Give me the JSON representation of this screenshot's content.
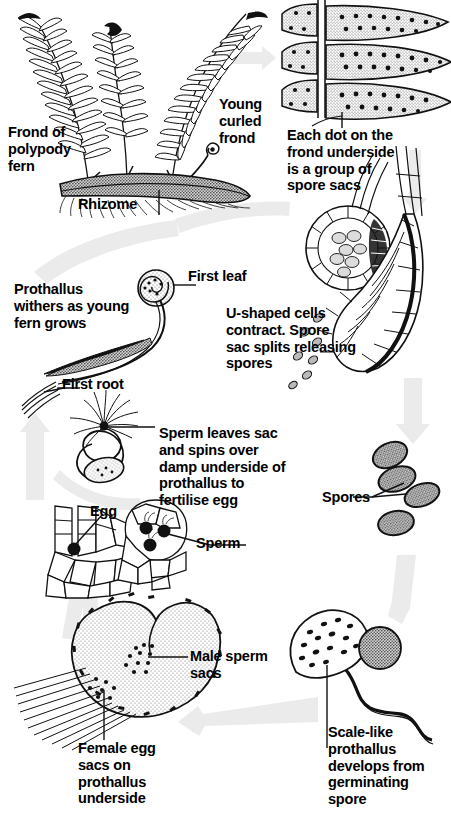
{
  "figure": {
    "type": "biological-life-cycle-diagram",
    "background_color": "#ffffff",
    "ink_color": "#111111",
    "arrow_color": "#ebebeb"
  },
  "labels": {
    "frond_of_polypody_fern": "Frond of\npolypody\nfern",
    "rhizome": "Rhizome",
    "young_curled_frond": "Young\ncurled\nfrond",
    "each_dot_spore_sacs": "Each dot on the\nfrond underside\nis a group of\nspore sacs",
    "prothallus_withers": "Prothallus\nwithers as young\nfern grows",
    "first_leaf": "First leaf",
    "first_root": "First root",
    "u_shaped_cells": "U-shaped cells\ncontract. Spore\nsac splits releasing\nspores",
    "sperm_leaves_sac": "Sperm leaves sac\nand spins over\ndamp underside of\nprothallus to\nfertilise egg",
    "spores": "Spores",
    "egg": "Egg",
    "sperm": "Sperm",
    "male_sperm_sacs": "Male sperm\nsacs",
    "female_egg_sacs": "Female egg\nsacs on\nprothallus\nunderside",
    "scale_like_prothallus": "Scale-like\nprothallus\ndevelops from\ngerminating\nspore"
  },
  "stages": [
    {
      "id": "sporophyte-frond",
      "label_key": "frond_of_polypody_fern"
    },
    {
      "id": "frond-underside-sori",
      "label_key": "each_dot_spore_sacs"
    },
    {
      "id": "sporangium-splitting",
      "label_key": "u_shaped_cells"
    },
    {
      "id": "spores",
      "label_key": "spores"
    },
    {
      "id": "germinating-spore",
      "label_key": "scale_like_prothallus"
    },
    {
      "id": "prothallus-gametophyte",
      "label_key": "female_egg_sacs"
    },
    {
      "id": "antheridium-archegonium",
      "label_key": "sperm"
    },
    {
      "id": "fertilisation",
      "label_key": "sperm_leaves_sac"
    },
    {
      "id": "young-sporophyte",
      "label_key": "prothallus_withers"
    }
  ],
  "cycle_arrows": [
    {
      "id": "arrow-frond-to-underside",
      "direction": "right"
    },
    {
      "id": "arrow-underside-to-sporangium",
      "direction": "down"
    },
    {
      "id": "arrow-sporangium-to-spores",
      "direction": "down"
    },
    {
      "id": "arrow-spores-to-germination",
      "direction": "down"
    },
    {
      "id": "arrow-germination-to-prothallus",
      "direction": "left"
    },
    {
      "id": "arrow-prothallus-to-gametes",
      "direction": "up"
    },
    {
      "id": "arrow-gametes-to-young-fern",
      "direction": "up"
    },
    {
      "id": "arrow-young-fern-to-frond",
      "direction": "up-left"
    }
  ]
}
